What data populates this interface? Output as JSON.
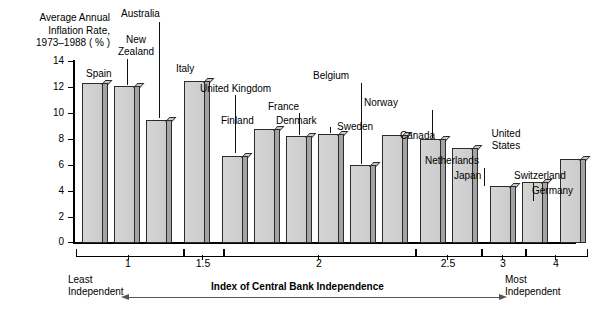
{
  "chart_data": {
    "type": "bar",
    "ylabel": "Average Annual Inflation Rate, 1973–1988 ( % )",
    "xlabel": "Index of Central Bank Independence",
    "ylim": [
      0,
      14
    ],
    "ytick_labels": [
      "0",
      "2",
      "4",
      "6",
      "8",
      "10",
      "12",
      "14"
    ],
    "ytick_values": [
      0,
      2,
      4,
      6,
      8,
      10,
      12,
      14
    ],
    "grid": false,
    "legend": "none",
    "categories": [
      "Spain",
      "New Zealand",
      "Australia",
      "Italy",
      "United Kingdom",
      "Finland",
      "France",
      "Denmark",
      "Belgium",
      "Sweden",
      "Norway",
      "Canada",
      "Netherlands",
      "Japan",
      "United States",
      "Switzerland",
      "Germany"
    ],
    "values": [
      12.3,
      12.1,
      9.5,
      12.5,
      6.7,
      8.8,
      8.25,
      8.4,
      6.0,
      8.3,
      8.0,
      7.3,
      4.4,
      4.7,
      6.5,
      3.2,
      3.5
    ],
    "group_tick_labels": [
      "1",
      "1.5",
      "2",
      "2.5",
      "3",
      "4"
    ],
    "groups": [
      {
        "label": "1",
        "members": [
          "Spain",
          "New Zealand",
          "Australia"
        ]
      },
      {
        "label": "1.5",
        "members": [
          "Italy"
        ]
      },
      {
        "label": "2",
        "members": [
          "United Kingdom",
          "Finland",
          "France",
          "Denmark",
          "Belgium",
          "Sweden"
        ]
      },
      {
        "label": "2.5",
        "members": [
          "Norway",
          "Canada"
        ]
      },
      {
        "label": "3",
        "members": [
          "Netherlands",
          "Japan"
        ]
      },
      {
        "label": "4",
        "members": [
          "United States",
          "Switzerland",
          "Germany"
        ]
      }
    ],
    "annotations": {
      "left_end": "Least\nIndependent",
      "right_end": "Most\nIndependent",
      "axis_title": "Index of Central Bank Independence"
    }
  },
  "labels": {
    "spain": "Spain",
    "new_zealand": "New\nZealand",
    "australia": "Australia",
    "italy": "Italy",
    "united_kingdom": "United Kingdom",
    "finland": "Finland",
    "france": "France",
    "denmark": "Denmark",
    "belgium": "Belgium",
    "sweden": "Sweden",
    "norway": "Norway",
    "canada": "Canada",
    "netherlands": "Netherlands",
    "japan": "Japan",
    "united_states": "United\nStates",
    "switzerland": "Switzerland",
    "germany": "Germany"
  },
  "ticks": {
    "t0": "0",
    "t2": "2",
    "t4": "4",
    "t6": "6",
    "t8": "8",
    "t10": "10",
    "t12": "12",
    "t14": "14"
  },
  "groups": {
    "g1": "1",
    "g15": "1.5",
    "g2": "2",
    "g25": "2.5",
    "g3": "3",
    "g4": "4"
  },
  "footer": {
    "least": "Least\nIndependent",
    "most": "Most\nIndependent",
    "axis_title": "Index of Central Bank Independence"
  },
  "ytitle": "Average Annual\nInflation Rate,\n1973–1988 ( % )"
}
